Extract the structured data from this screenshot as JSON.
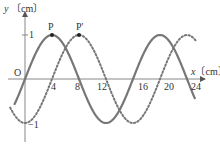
{
  "chart_data": {
    "type": "line",
    "title": "",
    "xlabel": "x〔cm〕",
    "ylabel": "y〔cm〕",
    "x_ticks": [
      4,
      8,
      12,
      16,
      20,
      24
    ],
    "y_ticks": [
      1,
      -1
    ],
    "origin_label": "O",
    "xlim": [
      -2,
      26
    ],
    "ylim": [
      -1.2,
      1.6
    ],
    "grid": false,
    "series": [
      {
        "name": "solid wave",
        "style": "solid",
        "color": "#707070",
        "function": "y = sin(2πx/16)",
        "amplitude": 1,
        "wavelength": 16,
        "x": [
          0,
          4,
          8,
          12,
          16,
          20,
          24
        ],
        "y": [
          0,
          1,
          0,
          -1,
          0,
          1,
          0
        ]
      },
      {
        "name": "dotted wave",
        "style": "dotted",
        "color": "#707070",
        "function": "y = sin(2π(x-4)/16)",
        "amplitude": 1,
        "wavelength": 16,
        "x": [
          0,
          4,
          8,
          12,
          16,
          20,
          24
        ],
        "y": [
          -1,
          0,
          1,
          0,
          -1,
          0,
          1
        ]
      }
    ],
    "annotations": [
      {
        "label": "P",
        "x": 4,
        "y": 1
      },
      {
        "label": "P'",
        "x": 8,
        "y": 1
      }
    ]
  },
  "labels": {
    "y_axis": "y〔cm〕",
    "x_axis": "x〔cm〕",
    "origin": "O",
    "one": "1",
    "minus_one": "−1",
    "t4": "4",
    "t8": "8",
    "t12": "12",
    "t16": "16",
    "t20": "20",
    "t24": "24",
    "p": "P",
    "p_prime": "P'"
  }
}
